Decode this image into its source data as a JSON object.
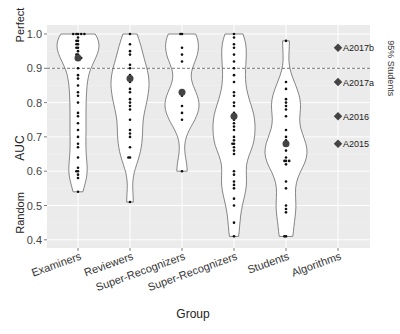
{
  "chart_data": {
    "type": "violin",
    "title": "",
    "xlabel": "Group",
    "ylabel": "AUC",
    "ylim": [
      0.38,
      1.02
    ],
    "yticks": [
      0.4,
      0.5,
      0.6,
      0.7,
      0.8,
      0.9,
      1.0
    ],
    "ytick_labels": [
      "0.4",
      "0.5",
      "0.6",
      "0.7",
      "0.8",
      "0.9",
      "1.0"
    ],
    "y_annotations": [
      {
        "label": "Perfect",
        "value": 1.0
      },
      {
        "label": "Random",
        "value": 0.5
      }
    ],
    "categories": [
      "Examiners",
      "Reviewers",
      "Super-Recognizers",
      "Super-Recognizers",
      "Students",
      "Algorithms"
    ],
    "reference_line": {
      "label": "95% Students",
      "value": 0.9,
      "style": "dashed"
    },
    "grid": true,
    "background": "#ebebeb",
    "series": [
      {
        "name": "Examiners",
        "range": [
          0.54,
          1.0
        ],
        "median": 0.93,
        "points": [
          1.0,
          1.0,
          1.0,
          1.0,
          1.0,
          0.99,
          0.98,
          0.98,
          0.97,
          0.97,
          0.96,
          0.96,
          0.95,
          0.94,
          0.94,
          0.93,
          0.93,
          0.93,
          0.9,
          0.88,
          0.87,
          0.85,
          0.83,
          0.82,
          0.8,
          0.77,
          0.76,
          0.74,
          0.72,
          0.7,
          0.68,
          0.67,
          0.64,
          0.61,
          0.6,
          0.6,
          0.59,
          0.58,
          0.54
        ]
      },
      {
        "name": "Reviewers",
        "range": [
          0.51,
          1.0
        ],
        "median": 0.87,
        "points": [
          1.0,
          0.97,
          0.95,
          0.94,
          0.91,
          0.9,
          0.88,
          0.87,
          0.87,
          0.86,
          0.84,
          0.83,
          0.81,
          0.8,
          0.79,
          0.78,
          0.75,
          0.72,
          0.71,
          0.7,
          0.67,
          0.64,
          0.64,
          0.51
        ]
      },
      {
        "name": "Super-Recognizers",
        "range": [
          0.6,
          1.0
        ],
        "median": 0.83,
        "points": [
          1.0,
          1.0,
          0.96,
          0.94,
          0.92,
          0.83,
          0.82,
          0.79,
          0.77,
          0.75,
          0.6
        ]
      },
      {
        "name": "Super-Recognizers",
        "range": [
          0.41,
          1.0
        ],
        "median": 0.76,
        "points": [
          1.0,
          0.99,
          0.97,
          0.96,
          0.94,
          0.92,
          0.9,
          0.88,
          0.86,
          0.83,
          0.82,
          0.8,
          0.79,
          0.77,
          0.76,
          0.76,
          0.75,
          0.74,
          0.73,
          0.72,
          0.7,
          0.69,
          0.68,
          0.68,
          0.67,
          0.66,
          0.65,
          0.6,
          0.59,
          0.57,
          0.56,
          0.55,
          0.52,
          0.5,
          0.45,
          0.41
        ]
      },
      {
        "name": "Students",
        "range": [
          0.41,
          0.98
        ],
        "median": 0.68,
        "points": [
          0.98,
          0.86,
          0.84,
          0.81,
          0.8,
          0.79,
          0.78,
          0.76,
          0.72,
          0.7,
          0.69,
          0.68,
          0.68,
          0.66,
          0.64,
          0.63,
          0.63,
          0.63,
          0.62,
          0.57,
          0.55,
          0.5,
          0.49,
          0.48,
          0.41,
          0.41
        ]
      },
      {
        "name": "Algorithms",
        "points_labeled": [
          {
            "label": "A2017b",
            "value": 0.96
          },
          {
            "label": "A2017a",
            "value": 0.86
          },
          {
            "label": "A2016",
            "value": 0.76
          },
          {
            "label": "A2015",
            "value": 0.68
          }
        ]
      }
    ]
  }
}
